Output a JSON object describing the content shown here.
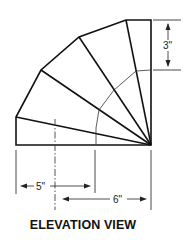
{
  "title": "ELEVATION VIEW",
  "dimensions": {
    "height_segment": "3\"",
    "left_throat": "5\"",
    "right_radius": "6\""
  },
  "colors": {
    "line": "#111111",
    "background": "#ffffff"
  }
}
